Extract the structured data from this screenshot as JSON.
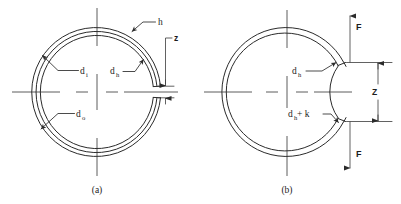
{
  "figure": {
    "background_color": "#ffffff",
    "line_color": "#2b2b2b",
    "panels": [
      {
        "id": "a",
        "caption": "(a)",
        "description": "Free-state retaining ring with concentric inner, housing and outer diameters and a narrow gap z at the right",
        "labels": [
          {
            "name": "h",
            "base": "h",
            "subscript": "",
            "description": "ring radial wall thickness, leader points to upper-right ring wall"
          },
          {
            "name": "d_i",
            "base": "d",
            "subscript": "i",
            "description": "inner diameter, leader points to upper-left inner arc"
          },
          {
            "name": "d_h",
            "base": "d",
            "subscript": "h",
            "description": "housing / groove diameter, leader points to middle arc"
          },
          {
            "name": "d_o",
            "base": "d",
            "subscript": "o",
            "description": "outer diameter, leader points to lower-left outer arc"
          },
          {
            "name": "z",
            "base": "z",
            "subscript": "",
            "description": "free gap width between the two ring ends"
          }
        ]
      },
      {
        "id": "b",
        "caption": "(b)",
        "description": "Expanded ring under applied forces F opening the gap to dimension Z",
        "labels": [
          {
            "name": "d_h",
            "base": "d",
            "subscript": "h",
            "description": "housing diameter, leader points to upper gap end"
          },
          {
            "name": "d_h_plus_k",
            "base": "d",
            "subscript": "h",
            "suffix": " + k",
            "description": "expanded diameter, leader points to lower gap end"
          },
          {
            "name": "Z",
            "base": "Z",
            "subscript": "",
            "description": "expanded gap dimension between ring ends"
          },
          {
            "name": "F_top",
            "base": "F",
            "subscript": "",
            "description": "applied force at upper ring end, arrow pointing up"
          },
          {
            "name": "F_bottom",
            "base": "F",
            "subscript": "",
            "description": "applied force at lower ring end, arrow pointing down"
          }
        ]
      }
    ]
  }
}
